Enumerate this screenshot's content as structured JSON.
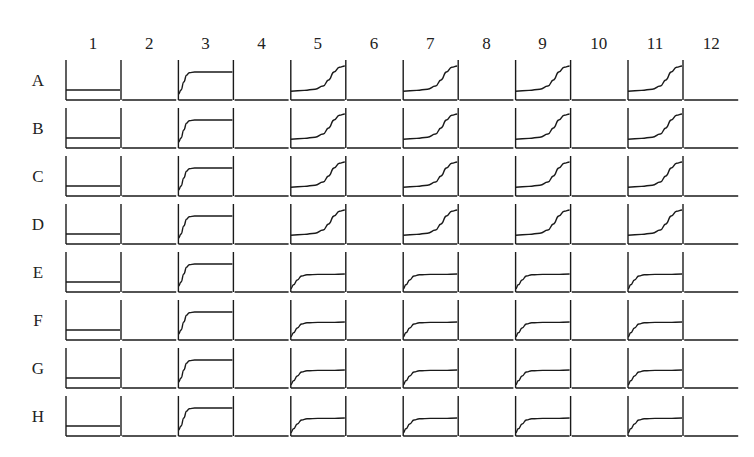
{
  "chart_data": {
    "type": "line",
    "title": "",
    "layout": "96-well plate grid of growth curves (8 rows x 12 columns)",
    "columns": [
      "1",
      "2",
      "3",
      "4",
      "5",
      "6",
      "7",
      "8",
      "9",
      "10",
      "11",
      "12"
    ],
    "rows": [
      "A",
      "B",
      "C",
      "D",
      "E",
      "F",
      "G",
      "H"
    ],
    "xlabel": "",
    "ylabel": "",
    "grid": false,
    "curve_types": {
      "flat": "constant low signal",
      "fast": "rapid early rise then plateau",
      "late": "late sigmoidal rise reaching max at end",
      "early": "early modest rise then plateau",
      "none": "empty well (baseline only)"
    },
    "wells": {
      "A": [
        "flat",
        "none",
        "fast",
        "none",
        "late",
        "none",
        "late",
        "none",
        "late",
        "none",
        "late",
        "none"
      ],
      "B": [
        "flat",
        "none",
        "fast",
        "none",
        "late",
        "none",
        "late",
        "none",
        "late",
        "none",
        "late",
        "none"
      ],
      "C": [
        "flat",
        "none",
        "fast",
        "none",
        "late",
        "none",
        "late",
        "none",
        "late",
        "none",
        "late",
        "none"
      ],
      "D": [
        "flat",
        "none",
        "fast",
        "none",
        "late",
        "none",
        "late",
        "none",
        "late",
        "none",
        "late",
        "none"
      ],
      "E": [
        "flat",
        "none",
        "fast",
        "none",
        "early",
        "none",
        "early",
        "none",
        "early",
        "none",
        "early",
        "none"
      ],
      "F": [
        "flat",
        "none",
        "fast",
        "none",
        "early",
        "none",
        "early",
        "none",
        "early",
        "none",
        "early",
        "none"
      ],
      "G": [
        "flat",
        "none",
        "fast",
        "none",
        "early",
        "none",
        "early",
        "none",
        "early",
        "none",
        "early",
        "none"
      ],
      "H": [
        "flat",
        "none",
        "fast",
        "none",
        "early",
        "none",
        "early",
        "none",
        "early",
        "none",
        "early",
        "none"
      ]
    },
    "series": [
      {
        "name": "flat",
        "x": [
          0,
          0.25,
          0.5,
          0.75,
          1
        ],
        "values": [
          0.25,
          0.25,
          0.25,
          0.25,
          0.25
        ]
      },
      {
        "name": "fast",
        "x": [
          0,
          0.05,
          0.1,
          0.15,
          0.2,
          0.3,
          0.5,
          0.75,
          1
        ],
        "values": [
          0.15,
          0.25,
          0.45,
          0.62,
          0.68,
          0.7,
          0.7,
          0.7,
          0.7
        ]
      },
      {
        "name": "late",
        "x": [
          0,
          0.25,
          0.45,
          0.6,
          0.7,
          0.8,
          0.9,
          1
        ],
        "values": [
          0.22,
          0.24,
          0.27,
          0.35,
          0.5,
          0.7,
          0.82,
          0.85
        ]
      },
      {
        "name": "early",
        "x": [
          0,
          0.05,
          0.12,
          0.2,
          0.3,
          0.5,
          0.75,
          1
        ],
        "values": [
          0.08,
          0.18,
          0.3,
          0.4,
          0.43,
          0.44,
          0.44,
          0.45
        ]
      }
    ],
    "ylim": [
      0,
      1
    ],
    "xlim": [
      0,
      1
    ]
  },
  "geometry": {
    "origin_x": 66,
    "col_pitch": 56.2,
    "well_width": 54,
    "row_first_baseline": 100,
    "row_pitch": 48,
    "well_height": 40,
    "col_label_y": 49,
    "row_label_x": 38
  }
}
